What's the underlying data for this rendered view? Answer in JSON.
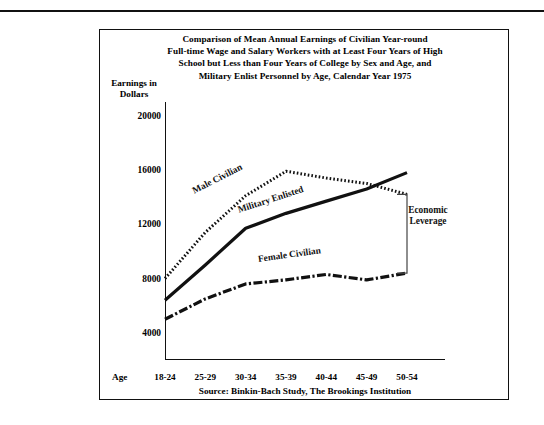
{
  "figure": {
    "title_lines": [
      "Comparison of Mean Annual Earnings of Civilian Year-round",
      "Full-time Wage and Salary Workers with at Least Four Years of High",
      "School but Less than Four Years of College by Sex and Age, and",
      "Military Enlist Personnel by Age, Calendar Year 1975"
    ],
    "source": "Source: Binkin-Bach Study, The Brookings Institution",
    "age_prefix": "Age:",
    "annotation": "Economic Leverage",
    "ink_color": "#111111",
    "background_color": "#ffffff"
  },
  "chart_data": {
    "type": "line",
    "xlabel": "Age",
    "ylabel": "Earnings in Dollars",
    "categories": [
      "18-24",
      "25-29",
      "30-34",
      "35-39",
      "40-44",
      "45-49",
      "50-54"
    ],
    "ylim": [
      2000,
      21000
    ],
    "yticks": [
      4000,
      8000,
      12000,
      16000,
      20000
    ],
    "ytick_labels": [
      "4000",
      "8000",
      "12000",
      "16000",
      "20000"
    ],
    "grid": false,
    "legend_position": "inline-labels",
    "series": [
      {
        "name": "Male Civilian",
        "style": "dotted",
        "values": [
          8000,
          11400,
          14100,
          15900,
          15400,
          15000,
          14200
        ]
      },
      {
        "name": "Military Enlisted",
        "style": "solid",
        "values": [
          6400,
          9000,
          11700,
          12800,
          13700,
          14600,
          15800
        ]
      },
      {
        "name": "Female Civilian",
        "style": "dash-dot",
        "values": [
          5000,
          6500,
          7600,
          7900,
          8300,
          7900,
          8400
        ]
      }
    ],
    "annotations": [
      {
        "text": "Economic Leverage",
        "type": "bracket",
        "at_category": "50-54",
        "from_value": 14200,
        "to_value": 8400
      }
    ]
  }
}
